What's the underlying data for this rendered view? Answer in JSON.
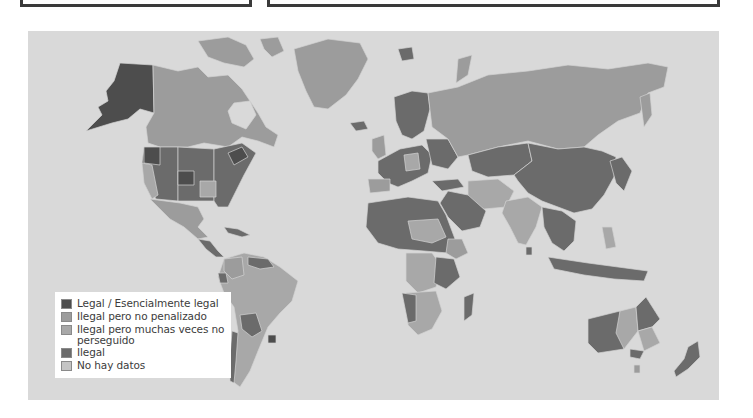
{
  "colors": {
    "page_background": "#ffffff",
    "ocean": "#d9d9d9",
    "legal": "#4d4d4d",
    "illegal_not_penalized": "#9c9c9c",
    "illegal_often_not_prosecuted": "#a8a8a8",
    "illegal": "#6b6b6b",
    "no_data": "#c4c4c4",
    "border": "#cfcfcf"
  },
  "top_boxes": [
    {
      "name": "left-panel"
    },
    {
      "name": "right-panel"
    }
  ],
  "map": {
    "legend": {
      "items": [
        {
          "label": "Legal / Esencialmente legal",
          "color": "#4d4d4d"
        },
        {
          "label": "Ilegal pero no penalizado",
          "color": "#9c9c9c"
        },
        {
          "label": "Ilegal pero muchas veces no perseguido",
          "color": "#a8a8a8"
        },
        {
          "label": "Ilegal",
          "color": "#6b6b6b"
        },
        {
          "label": "No hay datos",
          "color": "#c4c4c4"
        }
      ]
    }
  }
}
